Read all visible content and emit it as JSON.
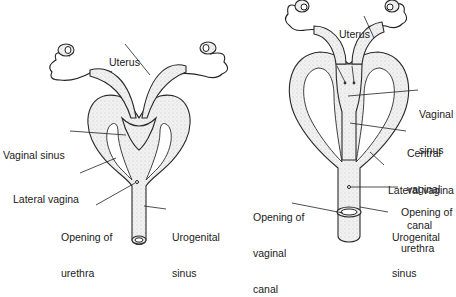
{
  "figure": {
    "left_panel": {
      "name": "Marsupial female reproductive tract (simple form)",
      "labels": {
        "uterus": "Uterus",
        "vaginal_sinus": "Vaginal sinus",
        "lateral_vagina": "Lateral vagina",
        "opening_urethra_line1": "Opening of",
        "opening_urethra_line2": "urethra",
        "urogenital_line1": "Urogenital",
        "urogenital_line2": "sinus"
      }
    },
    "right_panel": {
      "name": "Marsupial female reproductive tract with central vaginal canal",
      "labels": {
        "uterus": "Uterus",
        "vaginal_sinus_line1": "Vaginal",
        "vaginal_sinus_line2": "sinus",
        "central_line1": "Central",
        "central_line2": "vaginal",
        "central_line3": "canal",
        "lateral_vagina": "Lateral vagina",
        "opening_urethra_line1": "Opening of",
        "opening_urethra_line2": "urethra",
        "opening_vaginal_line1": "Opening of",
        "opening_vaginal_line2": "vaginal",
        "opening_vaginal_line3": "canal",
        "urogenital_line1": "Urogenital",
        "urogenital_line2": "sinus"
      }
    }
  }
}
